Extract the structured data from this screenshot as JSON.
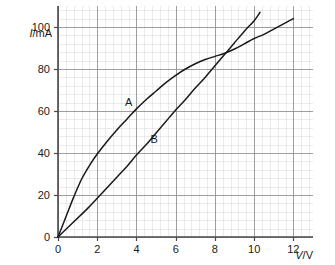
{
  "chart_data": {
    "type": "line",
    "title": "",
    "subtitle": "",
    "xlabel": "V/V",
    "ylabel": "I/mA",
    "xlabel_symbol": "V",
    "xlabel_unit": "/V",
    "ylabel_symbol": "I",
    "ylabel_unit": "/mA",
    "xlim": [
      0,
      13
    ],
    "ylim": [
      0,
      110
    ],
    "xticks": [
      0,
      2,
      4,
      6,
      8,
      10,
      12
    ],
    "yticks": [
      0,
      20,
      40,
      60,
      80,
      100
    ],
    "xtick_labels": [
      "0",
      "2",
      "4",
      "6",
      "8",
      "10",
      "12"
    ],
    "ytick_labels": [
      "0",
      "20",
      "40",
      "60",
      "80",
      "100"
    ],
    "x_minor_step": 0.4,
    "y_minor_step": 4,
    "grid": true,
    "grid_minor": true,
    "legend": "inline-annotations",
    "annotations": [
      {
        "text": "A",
        "x": 3.6,
        "y": 62.5
      },
      {
        "text": "B",
        "x": 4.9,
        "y": 45.0
      }
    ],
    "series": [
      {
        "name": "A",
        "description": "concave-down curve, filament lamp characteristic",
        "color": "#1a1a1a",
        "points": [
          [
            0.0,
            0.0
          ],
          [
            0.4,
            9.5
          ],
          [
            0.8,
            19.0
          ],
          [
            1.2,
            27.5
          ],
          [
            1.6,
            34.0
          ],
          [
            2.0,
            39.5
          ],
          [
            2.5,
            45.5
          ],
          [
            3.0,
            51.0
          ],
          [
            3.5,
            56.0
          ],
          [
            4.0,
            61.0
          ],
          [
            4.5,
            65.5
          ],
          [
            5.0,
            69.5
          ],
          [
            5.5,
            73.5
          ],
          [
            6.0,
            77.0
          ],
          [
            6.5,
            80.0
          ],
          [
            7.0,
            82.5
          ],
          [
            7.5,
            84.5
          ],
          [
            8.0,
            86.0
          ],
          [
            8.5,
            87.5
          ],
          [
            9.0,
            89.5
          ],
          [
            9.5,
            92.0
          ],
          [
            10.0,
            94.5
          ],
          [
            10.5,
            96.5
          ],
          [
            11.0,
            99.0
          ],
          [
            11.5,
            101.5
          ],
          [
            12.0,
            104.0
          ]
        ]
      },
      {
        "name": "B",
        "description": "near-linear curve with slight upward curvature",
        "color": "#1a1a1a",
        "points": [
          [
            0.0,
            0.0
          ],
          [
            0.5,
            4.5
          ],
          [
            1.0,
            9.0
          ],
          [
            1.5,
            13.5
          ],
          [
            2.0,
            18.5
          ],
          [
            2.5,
            23.5
          ],
          [
            3.0,
            28.5
          ],
          [
            3.5,
            33.5
          ],
          [
            4.0,
            39.0
          ],
          [
            4.5,
            44.0
          ],
          [
            5.0,
            49.5
          ],
          [
            5.5,
            55.0
          ],
          [
            6.0,
            60.5
          ],
          [
            6.5,
            65.5
          ],
          [
            7.0,
            71.0
          ],
          [
            7.5,
            76.0
          ],
          [
            8.0,
            81.5
          ],
          [
            8.5,
            87.0
          ],
          [
            9.0,
            92.5
          ],
          [
            9.5,
            98.0
          ],
          [
            10.0,
            103.0
          ],
          [
            10.3,
            107.0
          ]
        ]
      }
    ],
    "intersection": {
      "x": 8.3,
      "y": 87.0
    }
  },
  "axes": {
    "y_axis_caption": "I/mA",
    "x_axis_caption": "V/V"
  }
}
